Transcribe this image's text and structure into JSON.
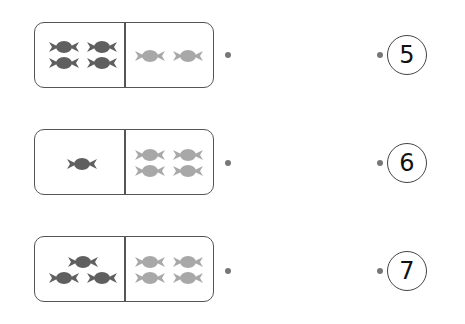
{
  "colors": {
    "dark_candy": "#5f5f5f",
    "light_candy": "#a8a8a8",
    "border": "#555555",
    "dot": "#777777"
  },
  "rows": [
    {
      "left_count": 4,
      "left_shade": "dark",
      "right_count": 2,
      "right_shade": "light",
      "number": "5"
    },
    {
      "left_count": 1,
      "left_shade": "dark",
      "right_count": 4,
      "right_shade": "light",
      "number": "6"
    },
    {
      "left_count": 3,
      "left_shade": "dark",
      "right_count": 4,
      "right_shade": "light",
      "number": "7"
    }
  ]
}
